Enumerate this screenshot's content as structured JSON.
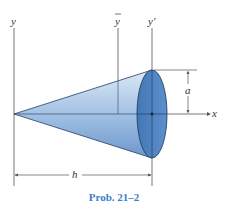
{
  "figure": {
    "labels": {
      "y_axis": "y",
      "y_bar_axis": "y",
      "y_prime_axis": "y′",
      "x_axis": "x",
      "radius_dim": "a",
      "height_dim": "h"
    },
    "caption": "Prob. 21–2",
    "colors": {
      "cone_light": "#c9dcf0",
      "cone_dark": "#7ea6d3",
      "base_disc": "#4f83bf",
      "outline": "#1f3f66",
      "axis_line": "#555555",
      "caption": "#3a7fc8"
    }
  }
}
